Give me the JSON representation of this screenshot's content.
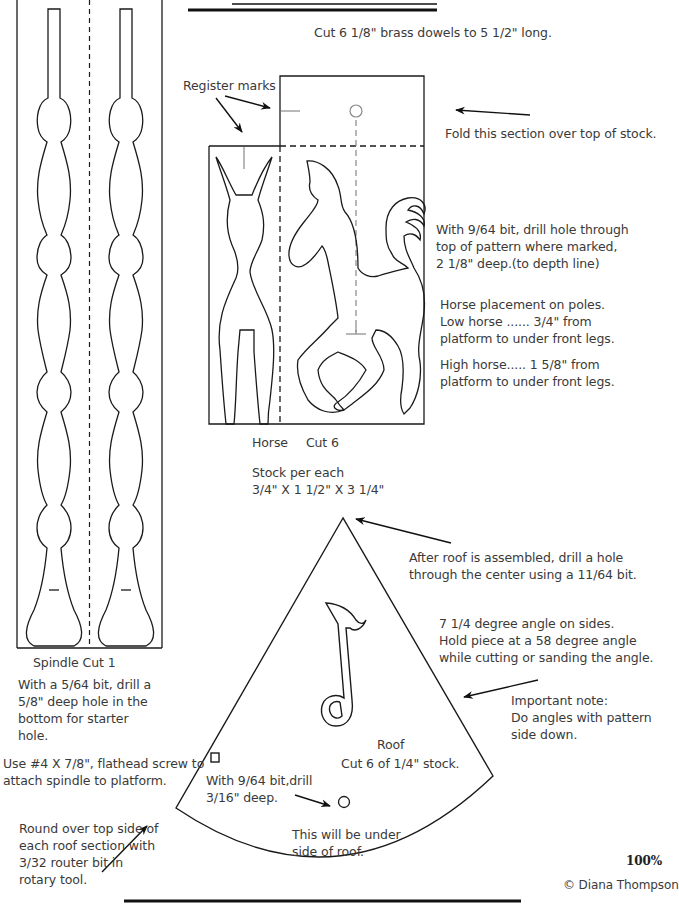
{
  "header": {
    "dowel_note": "Cut 6   1/8\" brass dowels to 5 1/2\" long."
  },
  "horse_section": {
    "register_marks_label": "Register marks",
    "fold_note": "Fold this section over top of stock.",
    "drill_note": [
      "With 9/64 bit, drill hole through",
      "top of pattern where marked,",
      "2 1/8\" deep.(to depth line)"
    ],
    "placement_note": [
      "Horse placement on poles.",
      "Low horse ...... 3/4\" from",
      "platform to under front legs."
    ],
    "high_horse_note": [
      "High horse..... 1 5/8\" from",
      "platform to under front legs."
    ],
    "caption_name": "Horse",
    "caption_cut": "Cut 6",
    "stock_label": "Stock  per each",
    "stock_dims": "3/4\" X 1 1/2\" X 3 1/4\""
  },
  "spindle_section": {
    "caption": "Spindle  Cut 1",
    "drill_note": [
      "With a 5/64 bit, drill a",
      "5/8\" deep hole in the",
      "bottom for starter",
      "hole."
    ],
    "screw_note": [
      "Use #4 X 7/8\", flathead screw to",
      " attach spindle to platform."
    ]
  },
  "roof_section": {
    "assembly_note": [
      "After roof is assembled, drill a hole",
      "through the center using a 11/64 bit."
    ],
    "angle_note": [
      "7 1/4 degree angle on sides.",
      "Hold piece at a 58 degree angle",
      "while cutting or sanding the angle."
    ],
    "important_note": [
      "Important note:",
      "Do angles with pattern",
      "side down."
    ],
    "roof_label": "Roof",
    "roof_cut": "Cut 6 of 1/4\" stock.",
    "drill_note": [
      "With 9/64 bit,drill",
      "3/16\" deep."
    ],
    "underside_note": [
      "This will be under",
      "side of roof."
    ],
    "roundover_note": [
      "Round over top side of",
      "each roof section with",
      "3/32 router bit in",
      "rotary tool."
    ]
  },
  "footer": {
    "scale": "100%",
    "copyright": "© Diana Thompson"
  },
  "colors": {
    "line": "#1a1a1a",
    "text": "#3a3a3a",
    "guide": "#888888"
  }
}
